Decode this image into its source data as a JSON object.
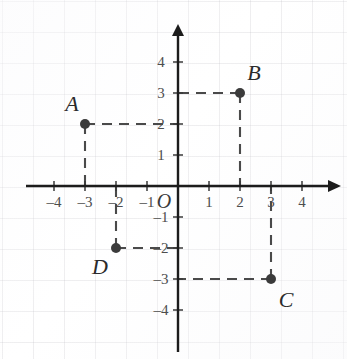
{
  "chart_data": {
    "type": "scatter",
    "title": "",
    "xlabel": "",
    "ylabel": "",
    "xlim": [
      -4.9,
      4.9
    ],
    "ylim": [
      -4.9,
      4.9
    ],
    "grid": true,
    "legend": null,
    "origin_label": "O",
    "x_ticks": [
      {
        "value": -4,
        "label": "-4"
      },
      {
        "value": -3,
        "label": "-3"
      },
      {
        "value": -2,
        "label": "-2"
      },
      {
        "value": -1,
        "label": "-1"
      },
      {
        "value": 1,
        "label": "1"
      },
      {
        "value": 2,
        "label": "2"
      },
      {
        "value": 3,
        "label": "3"
      },
      {
        "value": 4,
        "label": "4"
      }
    ],
    "y_ticks": [
      {
        "value": 4,
        "label": "4"
      },
      {
        "value": 3,
        "label": "3"
      },
      {
        "value": 2,
        "label": "2"
      },
      {
        "value": 1,
        "label": "1"
      },
      {
        "value": -1,
        "label": "-1"
      },
      {
        "value": -2,
        "label": "-2"
      },
      {
        "value": -3,
        "label": "-3"
      },
      {
        "value": -4,
        "label": "-4"
      }
    ],
    "points": [
      {
        "name": "A",
        "x": -3,
        "y": 2,
        "label_dx": -13,
        "label_dy": -20
      },
      {
        "name": "B",
        "x": 2,
        "y": 3,
        "label_dx": 14,
        "label_dy": -20
      },
      {
        "name": "C",
        "x": 3,
        "y": -3,
        "label_dx": 15,
        "label_dy": 21
      },
      {
        "name": "D",
        "x": -2,
        "y": -2,
        "label_dx": -16,
        "label_dy": 19
      }
    ],
    "leader_lines": "dashed guides from each point to both axes",
    "colors": {
      "axis": "#1c1c1c",
      "dot": "#3b3b3b",
      "dash": "#4a4a4a",
      "tick_text": "#4d4d4d",
      "point_text": "#2b2b2b",
      "grid": "#b4b2ba",
      "background": "#ffffff"
    }
  }
}
